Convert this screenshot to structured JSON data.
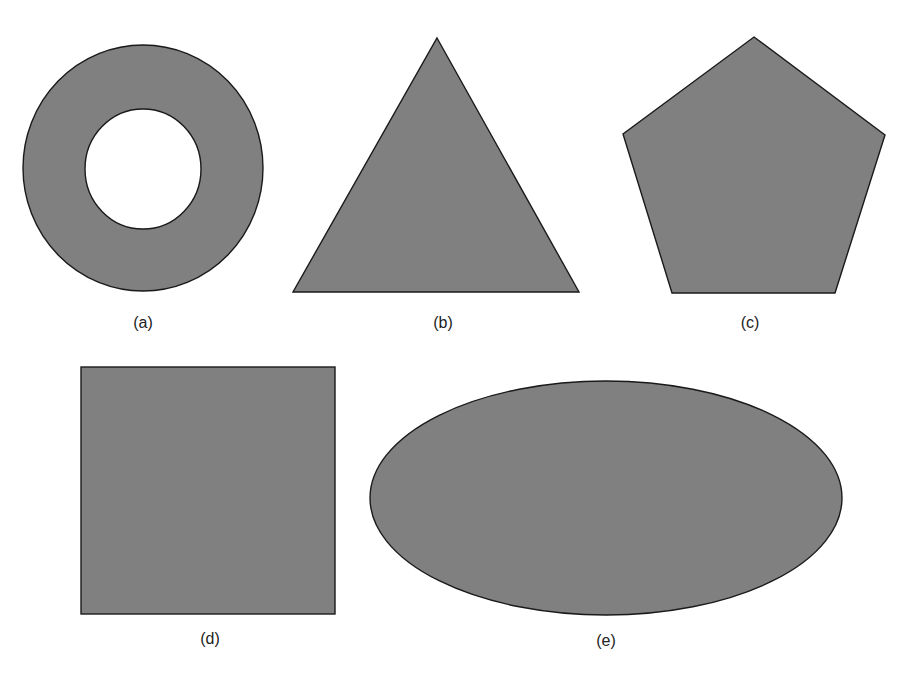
{
  "figure": {
    "fill_color": "#808080",
    "stroke_color": "#1a1a1a",
    "background_color": "#ffffff",
    "panels": [
      {
        "id": "a",
        "shape": "annulus",
        "label": "(a)"
      },
      {
        "id": "b",
        "shape": "triangle",
        "label": "(b)"
      },
      {
        "id": "c",
        "shape": "pentagon",
        "label": "(c)"
      },
      {
        "id": "d",
        "shape": "square",
        "label": "(d)"
      },
      {
        "id": "e",
        "shape": "ellipse",
        "label": "(e)"
      }
    ]
  }
}
